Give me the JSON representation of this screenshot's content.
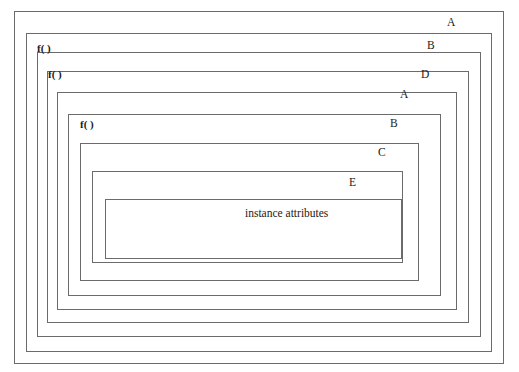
{
  "diagram": {
    "title": "instance attributes",
    "background_color": "#ffffff",
    "line_color": "#6b6b6b",
    "text_color": "#1a1a1a",
    "boxes": [
      {
        "id": "box-a-outer",
        "label": "A",
        "call_label": "",
        "x": 14,
        "y": 11,
        "w": 490,
        "h": 353
      },
      {
        "id": "box-b-outer",
        "label": "B",
        "call_label": "f( )",
        "x": 26,
        "y": 33,
        "w": 466,
        "h": 319
      },
      {
        "id": "box-d",
        "label": "D",
        "call_label": "f( )",
        "x": 37,
        "y": 52,
        "w": 444,
        "h": 285
      },
      {
        "id": "box-a-inner",
        "label": "A",
        "call_label": "",
        "x": 47,
        "y": 71,
        "w": 422,
        "h": 252
      },
      {
        "id": "box-b-inner",
        "label": "B",
        "call_label": "f( )",
        "x": 57,
        "y": 92,
        "w": 400,
        "h": 218
      },
      {
        "id": "box-c",
        "label": "C",
        "call_label": "",
        "x": 68,
        "y": 114,
        "w": 373,
        "h": 182
      },
      {
        "id": "box-e",
        "label": "E",
        "call_label": "",
        "x": 80,
        "y": 143,
        "w": 339,
        "h": 138
      },
      {
        "id": "box-instance",
        "label": "",
        "call_label": "",
        "x": 92,
        "y": 171,
        "w": 311,
        "h": 92
      },
      {
        "id": "box-attributes",
        "label": "",
        "call_label": "",
        "x": 105,
        "y": 199,
        "w": 297,
        "h": 60
      }
    ],
    "right_labels": [
      {
        "name": "label-a-outer",
        "text": "A",
        "x": 447,
        "y": 17
      },
      {
        "name": "label-b-outer",
        "text": "B",
        "x": 427,
        "y": 40
      },
      {
        "name": "label-d",
        "text": "D",
        "x": 421,
        "y": 69
      },
      {
        "name": "label-a-inner",
        "text": "A",
        "x": 400,
        "y": 89
      },
      {
        "name": "label-b-inner",
        "text": "B",
        "x": 390,
        "y": 118
      },
      {
        "name": "label-c",
        "text": "C",
        "x": 378,
        "y": 147
      },
      {
        "name": "label-e",
        "text": "E",
        "x": 349,
        "y": 177
      }
    ],
    "call_labels": [
      {
        "name": "call-label-1",
        "text": "f( )",
        "x": 37,
        "y": 43
      },
      {
        "name": "call-label-2",
        "text": "f( )",
        "x": 48,
        "y": 69
      },
      {
        "name": "call-label-3",
        "text": "f( )",
        "x": 80,
        "y": 119
      }
    ],
    "center_labels": [
      {
        "name": "instance-attributes-label",
        "text": "instance attributes",
        "x": 245,
        "y": 208
      }
    ]
  }
}
